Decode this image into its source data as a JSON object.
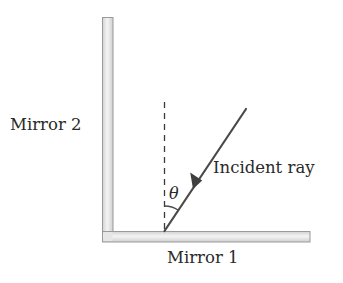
{
  "diagram": {
    "labels": {
      "mirror2": "Mirror 2",
      "mirror1": "Mirror 1",
      "incident_ray": "Incident ray",
      "angle": "θ"
    },
    "elements": {
      "mirror2": {
        "orientation": "vertical",
        "x": 102,
        "y": 17,
        "width": 11,
        "height": 225
      },
      "mirror1": {
        "orientation": "horizontal",
        "x": 102,
        "y": 231,
        "width": 208,
        "height": 11
      },
      "normal_line": {
        "style": "dashed",
        "x": 164,
        "y1": 102,
        "y2": 231
      },
      "incident_ray": {
        "from": [
          246,
          109
        ],
        "to": [
          164,
          231
        ],
        "arrow": "toward mirror"
      },
      "angle_arc": {
        "between": [
          "normal_line",
          "incident_ray"
        ],
        "symbol": "θ"
      }
    },
    "colors": {
      "mirror_fill": "#e4e4e4",
      "mirror_edge": "#9a9a9a",
      "ray": "#4a4a4a",
      "text": "#2a2a2a"
    }
  }
}
